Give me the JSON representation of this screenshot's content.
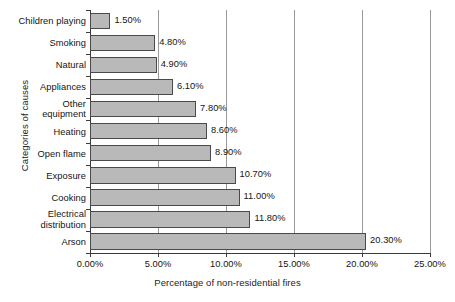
{
  "chart_data": {
    "type": "bar",
    "orientation": "horizontal",
    "title": "",
    "xlabel": "Percentage of non-residential fires",
    "ylabel": "Categories of causes",
    "categories": [
      "Children playing",
      "Smoking",
      "Natural",
      "Appliances",
      "Other equipment",
      "Heating",
      "Open flame",
      "Exposure",
      "Cooking",
      "Electrical distribution",
      "Arson"
    ],
    "values": [
      1.5,
      4.8,
      4.9,
      6.1,
      7.8,
      8.6,
      8.9,
      10.7,
      11.0,
      11.8,
      20.3
    ],
    "value_labels": [
      "1.50%",
      "4.80%",
      "4.90%",
      "6.10%",
      "7.80%",
      "8.60%",
      "8.90%",
      "10.70%",
      "11.00%",
      "11.80%",
      "20.30%"
    ],
    "xlim": [
      0,
      25
    ],
    "xticks": [
      0,
      5,
      10,
      15,
      20,
      25
    ],
    "xtick_labels": [
      "0.00%",
      "5.00%",
      "10.00%",
      "15.00%",
      "20.00%",
      "25.00%"
    ],
    "grid": true,
    "grid_axis": "x",
    "legend": false,
    "bar_color": "#b9b9b9",
    "bar_border_color": "#4a4a4a",
    "gridline_color": "#9a9a9a",
    "axis_color": "#3c3c3c",
    "text_color": "#141414",
    "background_color": "#ffffff"
  }
}
